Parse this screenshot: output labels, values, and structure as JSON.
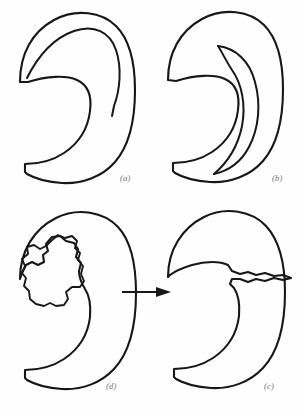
{
  "figure": {
    "background_color": "#fefefe",
    "stroke_color": "#171717",
    "caption_color": "#6f6f6f",
    "panel_count": 4,
    "layout": "2x2 grid"
  },
  "panels": [
    {
      "id": "a",
      "label": "(a)",
      "position": "top-left",
      "description": "Crescent / claw outline with a single interior arc terminating in free end"
    },
    {
      "id": "b",
      "label": "(b)",
      "position": "top-right",
      "description": "Crescent / claw outline with a nested inner crescent band"
    },
    {
      "id": "d",
      "label": "(d)",
      "position": "bottom-left",
      "description": "Crescent outline enclosing an irregular jagged blob-shaped interior void"
    },
    {
      "id": "c",
      "label": "(c)",
      "position": "bottom-right",
      "description": "Crescent outline with a narrow jagged spike/crack extending to the right edge"
    }
  ],
  "arrow": {
    "name": "transformation-arrow",
    "direction": "left-to-right",
    "from_panel": "d",
    "to_panel": "c",
    "color": "#171717"
  },
  "icons": {
    "arrow_right": "arrow-right-icon"
  }
}
